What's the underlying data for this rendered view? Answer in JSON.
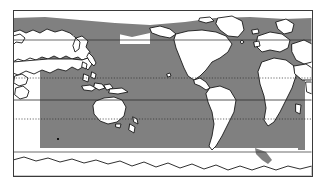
{
  "figure": {
    "type": "distribution-map",
    "title": "",
    "projection": "Pacific-centred cylindrical world map",
    "frame": {
      "x": 13,
      "y": 10,
      "width": 299,
      "height": 166,
      "stroke_color": "#3a3a3a",
      "stroke_width": 1,
      "fill_color": "#ffffff"
    },
    "colors": {
      "land_fill": "#ffffff",
      "land_stroke": "#1a1a1a",
      "ocean_fill": "#ffffff",
      "range_shading": "#808080",
      "graticule": "#2b2b2b",
      "frame": "#3a3a3a"
    },
    "legend": {
      "visible": false,
      "entries": [
        {
          "label": "Distribution range",
          "swatch": "#808080"
        }
      ]
    },
    "graticule": {
      "label": "latitude lines",
      "lines": [
        {
          "name": "60N",
          "y": 40,
          "style": "solid",
          "color": "#2b2b2b"
        },
        {
          "name": "Tropic of Cancer",
          "y": 78,
          "style": "dotted",
          "color": "#2b2b2b"
        },
        {
          "name": "Equator",
          "y": 100,
          "style": "solid",
          "color": "#2b2b2b"
        },
        {
          "name": "Tropic of Capricorn",
          "y": 119,
          "style": "dotted",
          "color": "#2b2b2b"
        },
        {
          "name": "60S",
          "y": 152,
          "style": "solid",
          "color": "#2b2b2b"
        }
      ]
    },
    "shaded_region": {
      "name": "grey-ocean-distribution",
      "description": "Shaded ocean band spanning the Pacific, Indian and Atlantic oceans plus a northern Arctic/North-Pacific rim band",
      "north_band_top_y": 18,
      "south_limit_y": 150,
      "fill": "#808080"
    },
    "markers": [
      {
        "name": "point-south-pacific",
        "x": 58,
        "y": 139,
        "color": "#111111",
        "size": 2
      }
    ],
    "annotations": []
  }
}
